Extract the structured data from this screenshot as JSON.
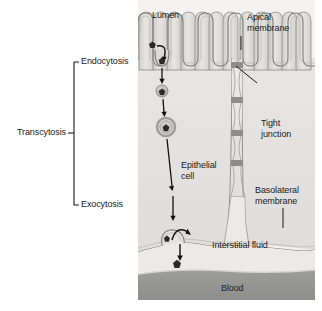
{
  "figure": {
    "background_color": "#ffffff"
  },
  "bracket": {
    "label": "Transcytosis",
    "top_label": "Endocytosis",
    "bottom_label": "Exocytosis",
    "stroke_color": "#1a1a1a"
  },
  "labels": {
    "lumen": "Lumen",
    "apical_membrane_line1": "Apical",
    "apical_membrane_line2": "membrane",
    "tight_junction_line1": "Tight",
    "tight_junction_line2": "junction",
    "epithelial_cell_line1": "Epithelial",
    "epithelial_cell_line2": "cell",
    "basolateral_membrane_line1": "Basolateral",
    "basolateral_membrane_line2": "membrane",
    "interstitial_fluid": "Interstitial fluid",
    "blood": "Blood"
  },
  "colors": {
    "lumen_fill": "#f2f2f0",
    "cytoplasm_fill": "#e4e3e1",
    "membrane_stroke": "#8a8a86",
    "microvilli_fill": "#dcdbd8",
    "interstitial_fill": "#e9e8e6",
    "blood_fill": "#9a9a98",
    "blood_edge": "#d8d8d5",
    "particle_fill": "#2a2a2a",
    "vesicle_ring": "#a9a8a4",
    "arrow_color": "#111111",
    "text_color": "#1a1a1a",
    "junction_band": "#8e8d8a"
  },
  "structures": {
    "microvilli_count": 12,
    "vesicle_stages": [
      "pit-particle",
      "coated-vesicle-small",
      "coated-vesicle-large",
      "fusing-vesicle",
      "released-particle"
    ]
  }
}
